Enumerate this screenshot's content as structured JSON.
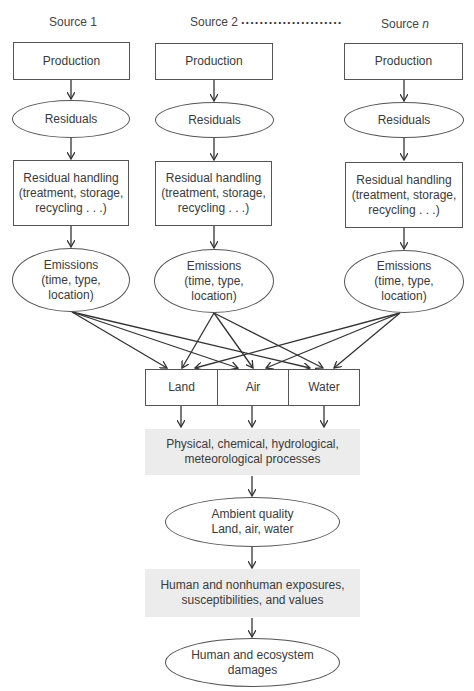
{
  "sources": [
    {
      "label": "Source 1",
      "production": "Production",
      "residuals": "Residuals",
      "handling": "Residual handling\n(treatment, storage,\nrecycling . . .)",
      "emissions": "Emissions\n(time, type,\nlocation)"
    },
    {
      "label": "Source 2",
      "production": "Production",
      "residuals": "Residuals",
      "handling": "Residual handling\n(treatment, storage,\nrecycling . . .)",
      "emissions": "Emissions\n(time, type,\nlocation)"
    },
    {
      "label_prefix": "Source ",
      "label_var": "n",
      "production": "Production",
      "residuals": "Residuals",
      "handling": "Residual handling\n(treatment, storage,\nrecycling . . .)",
      "emissions": "Emissions\n(time, type,\nlocation)"
    }
  ],
  "ellipsis_dots": "......................",
  "media": [
    "Land",
    "Air",
    "Water"
  ],
  "processes": "Physical, chemical, hydrological,\nmeteorological processes",
  "ambient_quality": "Ambient quality\nLand, air, water",
  "exposures": "Human and nonhuman exposures,\nsusceptibilities, and values",
  "damages": "Human and ecosystem\ndamages",
  "colors": {
    "line": "#333333",
    "process_fill": "#ececec",
    "text": "#3a3a3a"
  }
}
